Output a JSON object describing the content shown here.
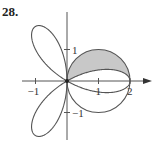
{
  "problem": {
    "number": "28."
  },
  "chart_data": {
    "type": "polar",
    "title": "",
    "curves": [
      {
        "name": "rose",
        "equation": "r = 2cos(3θ)",
        "petals": 3,
        "petal_length": 2
      },
      {
        "name": "circle",
        "equation": "r = 2cos(θ)",
        "center": [
          1,
          0
        ],
        "radius": 1
      }
    ],
    "shaded_region": "inside circle r = 2cosθ, outside rose petal, upper half (0 ≤ θ ≤ π/2 region between curves)",
    "axes": {
      "x_ticks": [
        {
          "value": -1,
          "label": "−1"
        },
        {
          "value": 1,
          "label": "1"
        },
        {
          "value": 2,
          "label": "2"
        }
      ],
      "y_ticks": [
        {
          "value": 1,
          "label": "1"
        },
        {
          "value": -1,
          "label": "−1"
        }
      ],
      "xlim": [
        -1.4,
        2.6
      ],
      "ylim": [
        -1.9,
        2.2
      ],
      "arrow_on_x": true,
      "grid": false
    },
    "colors": {
      "curve": "#555555",
      "shade": "#c8c8c8",
      "axis": "#555555"
    }
  }
}
